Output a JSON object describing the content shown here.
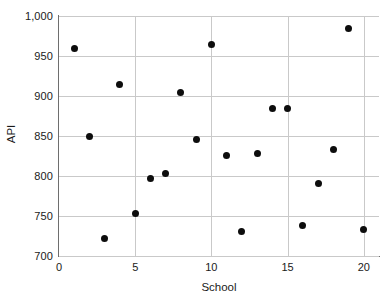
{
  "chart_data": {
    "type": "scatter",
    "title": "",
    "xlabel": "School",
    "ylabel": "API",
    "xlim": [
      0,
      21
    ],
    "ylim": [
      700,
      1000
    ],
    "grid": true,
    "legend": null,
    "marker": {
      "shape": "circle",
      "color": "#0d0d0d",
      "size_px": 7
    },
    "xticks": [
      0,
      5,
      10,
      15,
      20
    ],
    "xtick_labels": [
      "0",
      "5",
      "10",
      "15",
      "20"
    ],
    "yticks": [
      700,
      750,
      800,
      850,
      900,
      950,
      1000
    ],
    "ytick_labels": [
      "700",
      "750",
      "800",
      "850",
      "900",
      "950",
      "1,000"
    ],
    "x": [
      1,
      2,
      3,
      4,
      5,
      6,
      7,
      8,
      9,
      10,
      11,
      12,
      13,
      14,
      15,
      16,
      17,
      18,
      19,
      20
    ],
    "y": [
      960,
      850,
      722,
      915,
      753,
      797,
      803,
      904,
      846,
      965,
      826,
      731,
      828,
      885,
      885,
      738,
      791,
      833,
      984,
      733
    ],
    "points": [
      {
        "x": 1,
        "y": 960
      },
      {
        "x": 2,
        "y": 850
      },
      {
        "x": 3,
        "y": 722
      },
      {
        "x": 4,
        "y": 915
      },
      {
        "x": 5,
        "y": 753
      },
      {
        "x": 6,
        "y": 797
      },
      {
        "x": 7,
        "y": 803
      },
      {
        "x": 8,
        "y": 904
      },
      {
        "x": 9,
        "y": 846
      },
      {
        "x": 10,
        "y": 965
      },
      {
        "x": 11,
        "y": 826
      },
      {
        "x": 12,
        "y": 731
      },
      {
        "x": 13,
        "y": 828
      },
      {
        "x": 14,
        "y": 885
      },
      {
        "x": 15,
        "y": 885
      },
      {
        "x": 16,
        "y": 738
      },
      {
        "x": 17,
        "y": 791
      },
      {
        "x": 18,
        "y": 833
      },
      {
        "x": 19,
        "y": 984
      },
      {
        "x": 20,
        "y": 733
      }
    ]
  },
  "axes": {
    "x_title": "School",
    "y_title": "API"
  },
  "colors": {
    "marker": "#0d0d0d",
    "gridline": "#c9c9c9",
    "axis_line": "#6e6e6e",
    "background": "#ffffff",
    "text": "#1a1a1a"
  }
}
